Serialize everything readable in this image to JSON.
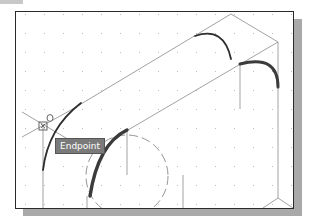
{
  "tooltip": {
    "label": "Endpoint"
  },
  "snap_marker": {
    "type": "endpoint",
    "glyph": "endpoint-snap-icon"
  },
  "cursor": {
    "type": "crosshair"
  },
  "colors": {
    "background": "#ffffff",
    "frame_border": "#2a2a2a",
    "shadow": "#a9a9a9",
    "grid_dot": "#bdbdbd",
    "geometry_line": "#8a8a8a",
    "arc_stroke": "#3a3a3a",
    "tooltip_bg": "#7a7a7a",
    "tooltip_text": "#ffffff"
  }
}
